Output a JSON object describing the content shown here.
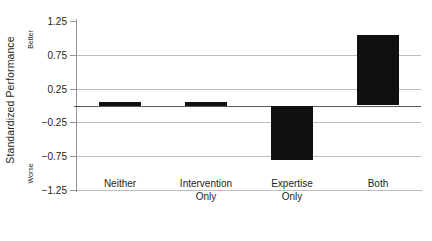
{
  "chart_data": {
    "type": "bar",
    "title": "",
    "xlabel": "",
    "ylabel": "Standardized Performance",
    "categories": [
      "Neither",
      "Intervention Only",
      "Expertise Only",
      "Both"
    ],
    "category_lines": [
      [
        "Neither",
        ""
      ],
      [
        "Intervention",
        "Only"
      ],
      [
        "Expertise",
        "Only"
      ],
      [
        "Both",
        ""
      ]
    ],
    "values": [
      0.02,
      0.04,
      -0.8,
      1.04
    ],
    "ylim": [
      -1.25,
      1.25
    ],
    "yticks": [
      1.25,
      0.75,
      0.25,
      -0.25,
      -0.75,
      -1.25
    ],
    "ytick_labels": [
      "1.25",
      "0.75",
      "0.25",
      "−0.25",
      "−0.75",
      "−1.25"
    ],
    "grid": true,
    "legend": "none",
    "zero_line": 0,
    "annotations": [
      {
        "name": "better",
        "text": "Better",
        "position": "y-axis-top"
      },
      {
        "name": "worse",
        "text": "Worse",
        "position": "y-axis-bottom"
      }
    ],
    "colors": {
      "bar": "#101010",
      "grid": "#bcbec0",
      "axis": "#939598",
      "zero": "#58595b",
      "text": "#231f20",
      "background": "#ffffff"
    }
  }
}
